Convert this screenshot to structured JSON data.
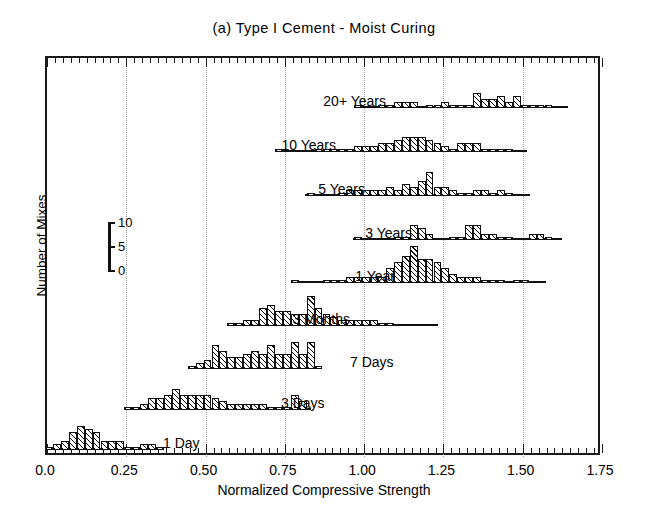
{
  "figure": {
    "title": "(a) Type I Cement - Moist Curing",
    "xtitle": "Normalized Compressive Strength",
    "ytitle": "Number of Mixes"
  },
  "scale_legend": {
    "ticks": [
      "10",
      "5",
      "0"
    ],
    "values": [
      10,
      5,
      0
    ]
  },
  "chart_data": {
    "type": "bar",
    "title": "(a) Type I Cement - Moist Curing",
    "xlabel": "Normalized Compressive Strength",
    "ylabel": "Number of Mixes",
    "xlim": [
      0.0,
      1.75
    ],
    "xticks": [
      0.0,
      0.25,
      0.5,
      0.75,
      1.0,
      1.25,
      1.5,
      1.75
    ],
    "xticklabels": [
      "0.0",
      "0.25",
      "0.50",
      "0.75",
      "1.00",
      "1.25",
      "1.50",
      "1.75"
    ],
    "xminor_step": 0.025,
    "ylim": [
      0,
      12
    ],
    "yticks": [
      0,
      5,
      10
    ],
    "grid": "vertical-dotted-at-major-x",
    "legend": "none",
    "bin_width": 0.025,
    "note": "Nine stacked histograms, one per curing age; each has its own zero baseline. Heights are number of mixes.",
    "series": [
      {
        "name": "20+ Years",
        "label": "20+ Years",
        "baseline_x": [
          0.98,
          1.65
        ],
        "bins": [
          0.9875,
          1.0125,
          1.0375,
          1.0625,
          1.0875,
          1.1125,
          1.1375,
          1.1625,
          1.1875,
          1.2125,
          1.2375,
          1.2625,
          1.2875,
          1.3125,
          1.3375,
          1.3625,
          1.3875,
          1.4125,
          1.4375,
          1.4625,
          1.4875,
          1.5125,
          1.5375,
          1.5625,
          1.5875,
          1.6125
        ],
        "values": [
          1,
          0,
          0,
          1,
          1,
          2,
          2,
          2,
          0,
          1,
          1,
          2,
          1,
          1,
          1,
          5,
          3,
          3,
          4,
          2,
          4,
          1,
          1,
          1,
          1,
          0
        ]
      },
      {
        "name": "10 Years",
        "label": "10 Years",
        "baseline_x": [
          0.73,
          1.52
        ],
        "bins": [
          0.7375,
          0.7625,
          0.7875,
          0.8125,
          0.8375,
          0.8625,
          0.8875,
          0.9125,
          0.9375,
          0.9625,
          0.9875,
          1.0125,
          1.0375,
          1.0625,
          1.0875,
          1.1125,
          1.1375,
          1.1625,
          1.1875,
          1.2125,
          1.2375,
          1.2625,
          1.2875,
          1.3125,
          1.3375,
          1.3625,
          1.3875,
          1.4125,
          1.4375,
          1.4625,
          1.4875
        ],
        "values": [
          1,
          0,
          0,
          0,
          0,
          1,
          1,
          1,
          1,
          1,
          2,
          2,
          2,
          3,
          3,
          4,
          5,
          5,
          5,
          4,
          3,
          2,
          1,
          3,
          3,
          3,
          1,
          1,
          1,
          1,
          0
        ]
      },
      {
        "name": "5 Years",
        "label": "5 Years",
        "baseline_x": [
          0.82,
          1.53
        ],
        "bins": [
          0.8375,
          0.8625,
          0.8875,
          0.9125,
          0.9375,
          0.9625,
          0.9875,
          1.0125,
          1.0375,
          1.0625,
          1.0875,
          1.1125,
          1.1375,
          1.1625,
          1.1875,
          1.2125,
          1.2375,
          1.2625,
          1.2875,
          1.3125,
          1.3375,
          1.3625,
          1.3875,
          1.4125,
          1.4375,
          1.4625,
          1.4875
        ],
        "values": [
          1,
          0,
          0,
          0,
          1,
          2,
          2,
          2,
          2,
          2,
          3,
          2,
          4,
          3,
          5,
          8,
          3,
          3,
          2,
          1,
          1,
          2,
          2,
          1,
          2,
          1,
          0
        ]
      },
      {
        "name": "3 Years",
        "label": "3 Years",
        "baseline_x": [
          0.97,
          1.63
        ],
        "bins": [
          0.9875,
          1.0125,
          1.0375,
          1.0625,
          1.0875,
          1.1125,
          1.1375,
          1.1625,
          1.1875,
          1.2125,
          1.2375,
          1.2625,
          1.2875,
          1.3125,
          1.3375,
          1.3625,
          1.3875,
          1.4125,
          1.4375,
          1.4625,
          1.4875,
          1.5125,
          1.5375,
          1.5625,
          1.5875,
          1.6125
        ],
        "values": [
          1,
          0,
          0,
          0,
          0,
          1,
          1,
          5,
          4,
          2,
          0,
          0,
          1,
          1,
          5,
          5,
          2,
          2,
          1,
          1,
          0,
          0,
          2,
          2,
          1,
          0
        ]
      },
      {
        "name": "1 Year",
        "label": "1 Year",
        "baseline_x": [
          0.78,
          1.58
        ],
        "bins": [
          0.7875,
          0.8125,
          0.8375,
          0.8625,
          0.8875,
          0.9125,
          0.9375,
          0.9625,
          0.9875,
          1.0125,
          1.0375,
          1.0625,
          1.0875,
          1.1125,
          1.1375,
          1.1625,
          1.1875,
          1.2125,
          1.2375,
          1.2625,
          1.2875,
          1.3125,
          1.3375,
          1.3625,
          1.3875,
          1.4125,
          1.4375,
          1.4625,
          1.4875,
          1.5125,
          1.5375
        ],
        "values": [
          1,
          0,
          0,
          0,
          1,
          1,
          1,
          2,
          2,
          2,
          2,
          2,
          5,
          7,
          9,
          12,
          8,
          8,
          7,
          5,
          3,
          2,
          2,
          2,
          1,
          1,
          1,
          0,
          1,
          1,
          0
        ]
      },
      {
        "name": "3 Months",
        "label": "3 Months",
        "baseline_x": [
          0.58,
          1.24
        ],
        "bins": [
          0.5875,
          0.6125,
          0.6375,
          0.6625,
          0.6875,
          0.7125,
          0.7375,
          0.7625,
          0.7875,
          0.8125,
          0.8375,
          0.8625,
          0.8875,
          0.9125,
          0.9375,
          0.9625,
          0.9875,
          1.0125,
          1.0375,
          1.0625,
          1.0875,
          1.1125,
          1.1375,
          1.1625,
          1.1875,
          1.2125
        ],
        "values": [
          1,
          1,
          2,
          2,
          6,
          7,
          5,
          5,
          4,
          4,
          10,
          6,
          4,
          3,
          2,
          2,
          2,
          2,
          2,
          1,
          1,
          0,
          0,
          0,
          0,
          0
        ]
      },
      {
        "name": "7 Days",
        "label": "7 Days",
        "baseline_x": [
          0.45,
          0.87
        ],
        "bins": [
          0.4625,
          0.4875,
          0.5125,
          0.5375,
          0.5625,
          0.5875,
          0.6125,
          0.6375,
          0.6625,
          0.6875,
          0.7125,
          0.7375,
          0.7625,
          0.7875,
          0.8125,
          0.8375,
          0.8625
        ],
        "values": [
          1,
          2,
          3,
          8,
          6,
          4,
          4,
          5,
          6,
          5,
          8,
          5,
          5,
          9,
          5,
          9,
          1
        ]
      },
      {
        "name": "3 Days",
        "label": "3 Days",
        "baseline_x": [
          0.26,
          0.84
        ],
        "bins": [
          0.2625,
          0.2875,
          0.3125,
          0.3375,
          0.3625,
          0.3875,
          0.4125,
          0.4375,
          0.4625,
          0.4875,
          0.5125,
          0.5375,
          0.5625,
          0.5875,
          0.6125,
          0.6375,
          0.6625,
          0.6875,
          0.7125,
          0.7375,
          0.7625,
          0.7875,
          0.8125
        ],
        "values": [
          1,
          1,
          2,
          4,
          4,
          5,
          7,
          5,
          5,
          5,
          5,
          4,
          3,
          2,
          2,
          2,
          2,
          2,
          1,
          1,
          1,
          5,
          3
        ]
      },
      {
        "name": "1 Day",
        "label": "1 Day",
        "baseline_x": [
          0.0,
          0.37
        ],
        "bins": [
          0.0125,
          0.0375,
          0.0625,
          0.0875,
          0.1125,
          0.1375,
          0.1625,
          0.1875,
          0.2125,
          0.2375,
          0.2625,
          0.2875,
          0.3125,
          0.3375,
          0.3625
        ],
        "values": [
          1,
          2,
          3,
          6,
          8,
          7,
          6,
          3,
          3,
          3,
          1,
          1,
          2,
          2,
          1
        ]
      }
    ]
  }
}
